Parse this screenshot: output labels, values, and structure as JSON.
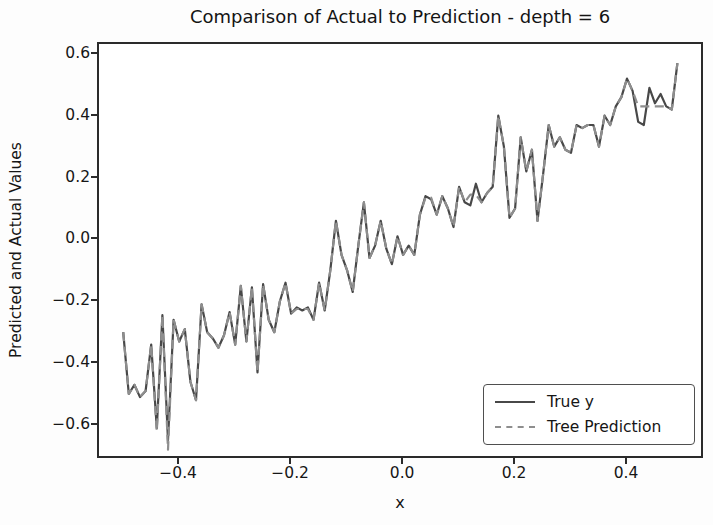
{
  "figure": {
    "type": "matplotlib-figure"
  },
  "chart_data": {
    "type": "line",
    "title": "Comparison of Actual to Prediction - depth = 6",
    "xlabel": "x",
    "ylabel": "Predicted and Actual Values",
    "grid": false,
    "legend_position": "lower right",
    "xlim": [
      -0.545,
      0.5375
    ],
    "ylim": [
      -0.71,
      0.635
    ],
    "x_tick_values": [
      -0.4,
      -0.2,
      0.0,
      0.2,
      0.4
    ],
    "x_tick_labels": [
      "−0.4",
      "−0.2",
      "0.0",
      "0.2",
      "0.4"
    ],
    "y_tick_values": [
      0.6,
      0.4,
      0.2,
      0.0,
      -0.2,
      -0.4,
      -0.6
    ],
    "y_tick_labels": [
      "0.6",
      "0.4",
      "0.2",
      "0.0",
      "−0.2",
      "−0.4",
      "−0.6"
    ],
    "frame_color": "#2b2b2b",
    "x": [
      -0.5,
      -0.49,
      -0.48,
      -0.47,
      -0.46,
      -0.45,
      -0.44,
      -0.43,
      -0.42,
      -0.41,
      -0.4,
      -0.39,
      -0.38,
      -0.37,
      -0.36,
      -0.35,
      -0.34,
      -0.33,
      -0.32,
      -0.31,
      -0.3,
      -0.29,
      -0.28,
      -0.27,
      -0.26,
      -0.25,
      -0.24,
      -0.23,
      -0.22,
      -0.21,
      -0.2,
      -0.19,
      -0.18,
      -0.17,
      -0.16,
      -0.15,
      -0.14,
      -0.13,
      -0.12,
      -0.11,
      -0.1,
      -0.09,
      -0.08,
      -0.07,
      -0.06,
      -0.05,
      -0.04,
      -0.03,
      -0.02,
      -0.01,
      0.0,
      0.01,
      0.02,
      0.03,
      0.04,
      0.05,
      0.06,
      0.07,
      0.08,
      0.09,
      0.1,
      0.11,
      0.12,
      0.13,
      0.14,
      0.15,
      0.16,
      0.17,
      0.18,
      0.19,
      0.2,
      0.21,
      0.22,
      0.23,
      0.24,
      0.25,
      0.26,
      0.27,
      0.28,
      0.29,
      0.3,
      0.31,
      0.32,
      0.33,
      0.34,
      0.35,
      0.36,
      0.37,
      0.38,
      0.39,
      0.4,
      0.41,
      0.42,
      0.43,
      0.44,
      0.45,
      0.46,
      0.47,
      0.48,
      0.49
    ],
    "series": [
      {
        "name": "True y",
        "style": "solid",
        "color": "#484848",
        "values": [
          -0.3,
          -0.5,
          -0.47,
          -0.51,
          -0.49,
          -0.34,
          -0.61,
          -0.245,
          -0.65,
          -0.26,
          -0.33,
          -0.29,
          -0.46,
          -0.52,
          -0.21,
          -0.3,
          -0.32,
          -0.35,
          -0.31,
          -0.235,
          -0.34,
          -0.15,
          -0.33,
          -0.155,
          -0.43,
          -0.145,
          -0.26,
          -0.3,
          -0.2,
          -0.14,
          -0.24,
          -0.22,
          -0.23,
          -0.22,
          -0.26,
          -0.14,
          -0.23,
          -0.1,
          0.06,
          -0.05,
          -0.1,
          -0.17,
          -0.02,
          0.12,
          -0.06,
          -0.02,
          0.06,
          -0.03,
          -0.08,
          0.01,
          -0.05,
          -0.02,
          -0.05,
          0.08,
          0.14,
          0.13,
          0.08,
          0.14,
          0.1,
          0.04,
          0.17,
          0.12,
          0.11,
          0.18,
          0.12,
          0.15,
          0.17,
          0.4,
          0.3,
          0.07,
          0.1,
          0.33,
          0.22,
          0.29,
          0.06,
          0.21,
          0.37,
          0.3,
          0.33,
          0.29,
          0.28,
          0.37,
          0.36,
          0.37,
          0.37,
          0.3,
          0.4,
          0.37,
          0.43,
          0.46,
          0.52,
          0.48,
          0.38,
          0.37,
          0.49,
          0.44,
          0.47,
          0.43,
          0.42,
          0.57
        ]
      },
      {
        "name": "Tree Prediction",
        "style": "dashed",
        "color": "#8e8e8e",
        "values": [
          -0.3,
          -0.5,
          -0.47,
          -0.51,
          -0.49,
          -0.34,
          -0.62,
          -0.245,
          -0.68,
          -0.26,
          -0.33,
          -0.29,
          -0.46,
          -0.52,
          -0.21,
          -0.3,
          -0.32,
          -0.35,
          -0.31,
          -0.235,
          -0.34,
          -0.15,
          -0.33,
          -0.155,
          -0.43,
          -0.145,
          -0.26,
          -0.3,
          -0.2,
          -0.14,
          -0.24,
          -0.225,
          -0.225,
          -0.225,
          -0.26,
          -0.14,
          -0.23,
          -0.1,
          0.06,
          -0.05,
          -0.1,
          -0.17,
          -0.02,
          0.12,
          -0.06,
          -0.02,
          0.06,
          -0.03,
          -0.08,
          0.01,
          -0.05,
          -0.02,
          -0.05,
          0.08,
          0.135,
          0.135,
          0.08,
          0.14,
          0.1,
          0.04,
          0.17,
          0.12,
          0.145,
          0.145,
          0.12,
          0.15,
          0.17,
          0.4,
          0.3,
          0.07,
          0.1,
          0.33,
          0.22,
          0.29,
          0.06,
          0.21,
          0.37,
          0.3,
          0.33,
          0.29,
          0.28,
          0.37,
          0.36,
          0.37,
          0.37,
          0.3,
          0.4,
          0.37,
          0.43,
          0.46,
          0.52,
          0.48,
          0.43,
          0.43,
          0.43,
          0.43,
          0.43,
          0.43,
          0.42,
          0.57
        ]
      }
    ]
  }
}
